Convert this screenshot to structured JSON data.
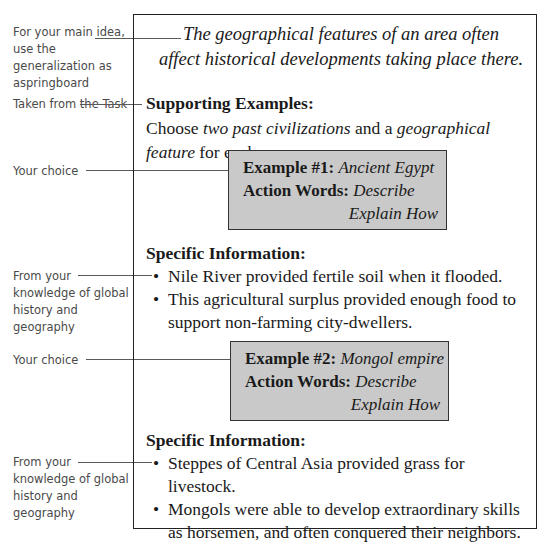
{
  "annotations": {
    "main_idea": "For your main idea, use the generalization as aspringboard",
    "task": "Taken from the Task",
    "choice_1": "Your choice",
    "knowledge_1": "From your knowledge of global history and geography",
    "choice_2": "Your choice",
    "knowledge_2": "From your knowledge of global history and geography"
  },
  "main_idea": {
    "line1": "The geographical features of an area often",
    "line2": "affect historical developments taking place there."
  },
  "supporting": {
    "heading": "Supporting Examples:",
    "instruction_prefix": "Choose ",
    "instruction_em1": "two past civilizations",
    "instruction_mid": " and a ",
    "instruction_em2": "geographical feature",
    "instruction_suffix": " for each"
  },
  "examples": [
    {
      "label": "Example #1:",
      "value": "Ancient Egypt",
      "action_label": "Action Words:",
      "action_1": "Describe",
      "action_2": "Explain How",
      "info_heading": "Specific Information:",
      "bullets": [
        "Nile River provided fertile soil when it flooded.",
        "This agricultural surplus provided enough food to support non-farming city-dwellers."
      ]
    },
    {
      "label": "Example #2:",
      "value": "Mongol empire",
      "action_label": "Action Words:",
      "action_1": "Describe",
      "action_2": "Explain How",
      "info_heading": "Specific Information:",
      "bullets": [
        "Steppes of Central Asia provided grass for livestock.",
        "Mongols were able to develop extraordinary skills as horsemen, and often conquered their neighbors."
      ]
    }
  ],
  "bullet_glyph": "•"
}
